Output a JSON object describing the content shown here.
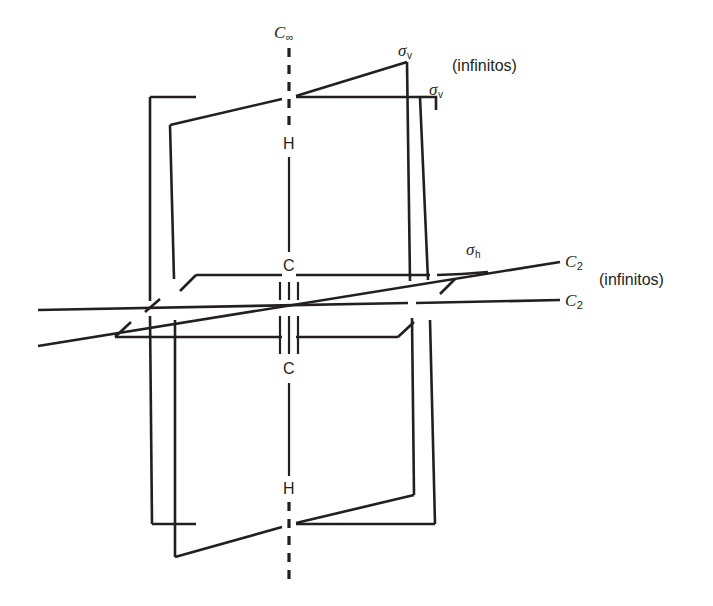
{
  "figure": {
    "background_color": "#ffffff",
    "line_color": "#231f20"
  },
  "atoms": [
    {
      "id": "h-top",
      "label": "H",
      "x": 289,
      "y": 144
    },
    {
      "id": "c-top",
      "label": "C",
      "x": 289,
      "y": 266
    },
    {
      "id": "c-bottom",
      "label": "C",
      "x": 289,
      "y": 369
    },
    {
      "id": "h-bottom",
      "label": "H",
      "x": 289,
      "y": 489
    }
  ],
  "bonds": {
    "triple_bond_label": "triple-bond",
    "single_bond_label": "single-bond"
  },
  "symmetry_labels": [
    {
      "id": "c-infinity",
      "symbol": "C",
      "sub": "∞",
      "x": 277,
      "y": 30,
      "note": ""
    },
    {
      "id": "sigma-v-1",
      "symbol": "σ",
      "sub": "v",
      "x": 399,
      "y": 48,
      "note": ""
    },
    {
      "id": "sigma-v-2",
      "symbol": "σ",
      "sub": "v",
      "x": 430,
      "y": 87,
      "note": ""
    },
    {
      "id": "sigma-h",
      "symbol": "σ",
      "sub": "h",
      "x": 468,
      "y": 247,
      "note": ""
    },
    {
      "id": "c2-1",
      "symbol": "C",
      "sub": "2",
      "x": 568,
      "y": 258,
      "note": ""
    },
    {
      "id": "c2-2",
      "symbol": "C",
      "sub": "2",
      "x": 568,
      "y": 297,
      "note": ""
    }
  ],
  "notes": [
    {
      "id": "note-sigma-v",
      "text": "(infinitos)",
      "x": 455,
      "y": 58
    },
    {
      "id": "note-c2",
      "text": "(infinitos)",
      "x": 602,
      "y": 273
    }
  ]
}
